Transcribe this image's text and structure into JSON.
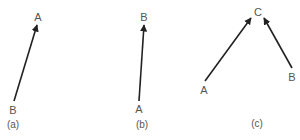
{
  "panels": [
    {
      "caption": "(a)",
      "from_label": "B",
      "to_label": "A",
      "arrows": [
        {
          "from": "B",
          "to": "A"
        }
      ]
    },
    {
      "caption": "(b)",
      "from_label": "A",
      "to_label": "B",
      "arrows": [
        {
          "from": "A",
          "to": "B"
        }
      ]
    },
    {
      "caption": "(c)",
      "labels": [
        "A",
        "B",
        "C"
      ],
      "arrows": [
        {
          "from": "A",
          "to": "C"
        },
        {
          "from": "B",
          "to": "C"
        }
      ]
    }
  ],
  "colors": {
    "arrow": "#222222",
    "label": "#555555",
    "background": "#ffffff"
  }
}
